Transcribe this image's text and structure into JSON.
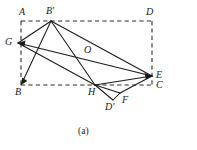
{
  "figure": {
    "caption": "(a)",
    "stroke_color": "#1a1a1a",
    "dash_color": "#2b2b2b",
    "background": "#ffffff",
    "labels": {
      "A": "A",
      "B": "B",
      "C": "C",
      "D": "D",
      "E": "E",
      "F": "F",
      "G": "G",
      "H": "H",
      "O": "O",
      "Bprime": "B′",
      "Dprime": "D′"
    },
    "points": {
      "A": {
        "x": 21,
        "y": 21
      },
      "D": {
        "x": 152,
        "y": 21
      },
      "B": {
        "x": 21,
        "y": 85
      },
      "C": {
        "x": 152,
        "y": 85
      },
      "Bprime": {
        "x": 51,
        "y": 21
      },
      "G": {
        "x": 18,
        "y": 43
      },
      "O": {
        "x": 85,
        "y": 57
      },
      "E": {
        "x": 152,
        "y": 76
      },
      "H": {
        "x": 95,
        "y": 85
      },
      "F": {
        "x": 120,
        "y": 93
      },
      "Dprime": {
        "x": 113,
        "y": 100
      }
    },
    "dashed_edges": [
      {
        "name": "edge-AD",
        "from": "A",
        "to": "D"
      },
      {
        "name": "edge-AB",
        "from": "A",
        "to": "B"
      },
      {
        "name": "edge-BC",
        "from": "B",
        "to": "C"
      },
      {
        "name": "edge-DC",
        "from": "D",
        "to": "C"
      }
    ],
    "solid_edges": [
      {
        "name": "segment-Bprime-G",
        "from": "Bprime",
        "to": "G"
      },
      {
        "name": "segment-Bprime-B",
        "from": "Bprime",
        "to": "B"
      },
      {
        "name": "segment-Bprime-H",
        "from": "Bprime",
        "to": "H"
      },
      {
        "name": "segment-Bprime-E",
        "from": "Bprime",
        "to": "E"
      },
      {
        "name": "segment-G-E",
        "from": "G",
        "to": "E"
      },
      {
        "name": "segment-G-H",
        "from": "G",
        "to": "H"
      },
      {
        "name": "segment-H-E",
        "from": "H",
        "to": "E"
      },
      {
        "name": "segment-H-F",
        "from": "H",
        "to": "F"
      },
      {
        "name": "segment-H-Dprime",
        "from": "H",
        "to": "Dprime"
      },
      {
        "name": "segment-Dprime-F",
        "from": "Dprime",
        "to": "F"
      },
      {
        "name": "segment-F-E",
        "from": "F",
        "to": "E"
      }
    ],
    "label_positions": {
      "A": {
        "x": 19,
        "y": 7
      },
      "Bprime": {
        "x": 46,
        "y": 6
      },
      "D": {
        "x": 146,
        "y": 7
      },
      "G": {
        "x": 5,
        "y": 37
      },
      "O": {
        "x": 84,
        "y": 45
      },
      "E": {
        "x": 156,
        "y": 70
      },
      "C": {
        "x": 156,
        "y": 80
      },
      "B": {
        "x": 15,
        "y": 87
      },
      "H": {
        "x": 88,
        "y": 87
      },
      "F": {
        "x": 122,
        "y": 95
      },
      "Dprime": {
        "x": 105,
        "y": 102
      }
    },
    "caption_position": {
      "x": 78,
      "y": 126
    }
  }
}
